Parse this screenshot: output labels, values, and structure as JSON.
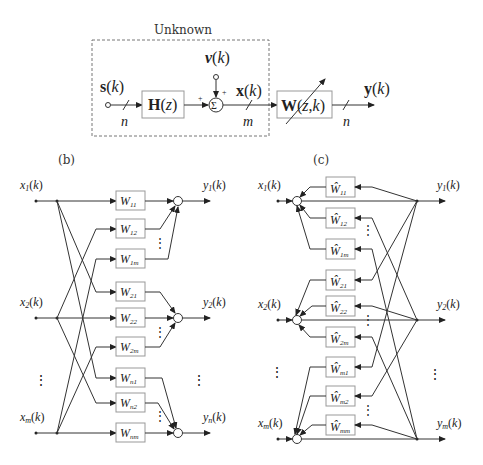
{
  "panel_a": {
    "unknown_label": "Unknown",
    "source_label": "s(k)",
    "noise_label": "v(k)",
    "mixed_label": "x(k)",
    "output_label": "y(k)",
    "mixing_block": "H(z)",
    "demixing_block": "W(z,k)",
    "dim_source": "n",
    "dim_mixed": "m",
    "dim_output": "n",
    "sum_symbol": "Σ",
    "plus": "+"
  },
  "panel_b": {
    "label": "(b)",
    "inputs": [
      "x1(k)",
      "x2(k)",
      "xm(k)"
    ],
    "outputs": [
      "y1(k)",
      "y2(k)",
      "yn(k)"
    ],
    "filters": [
      "W11",
      "W12",
      "W1m",
      "W21",
      "W22",
      "W2m",
      "Wn1",
      "Wn2",
      "Wnm"
    ],
    "ellipsis": "⋮",
    "sum_symbol": "Σ",
    "sign": "+"
  },
  "panel_c": {
    "label": "(c)",
    "inputs": [
      "x1(k)",
      "x2(k)",
      "xm(k)"
    ],
    "outputs": [
      "y1(k)",
      "y2(k)",
      "ym(k)"
    ],
    "filters": [
      "Ŵ11",
      "Ŵ12",
      "Ŵ1m",
      "Ŵ21",
      "Ŵ22",
      "Ŵ2m",
      "Ŵm1",
      "Ŵm2",
      "Ŵmm"
    ],
    "ellipsis": "⋮",
    "sum_symbol": "Σ",
    "sign": "−"
  }
}
